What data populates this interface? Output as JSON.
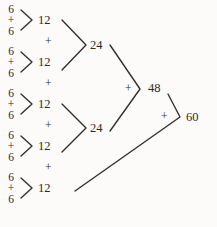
{
  "diagram": {
    "ink_color": "#2b2a29",
    "background_color": "#fcfbfa",
    "addend": "6",
    "plus": "+",
    "leaves": [
      {
        "top": "6",
        "op": "+",
        "bottom": "6",
        "sum": "12"
      },
      {
        "top": "6",
        "op": "+",
        "bottom": "6",
        "sum": "12"
      },
      {
        "top": "6",
        "op": "+",
        "bottom": "6",
        "sum": "12"
      },
      {
        "top": "6",
        "op": "+",
        "bottom": "6",
        "sum": "12"
      },
      {
        "top": "6",
        "op": "+",
        "bottom": "6",
        "sum": "12"
      }
    ],
    "connectors": [
      {
        "op": "+",
        "between": "12 and 12",
        "sum": "24"
      },
      {
        "op": "+",
        "between": "12 and 12",
        "sum": "24"
      },
      {
        "op": "+",
        "between": "24 and 24",
        "sum": "48"
      },
      {
        "op": "+",
        "between": "48 and 12",
        "sum": "60"
      }
    ],
    "level2": [
      {
        "value": "24"
      },
      {
        "value": "24"
      }
    ],
    "level3": {
      "value": "48"
    },
    "total": {
      "value": "60"
    }
  }
}
